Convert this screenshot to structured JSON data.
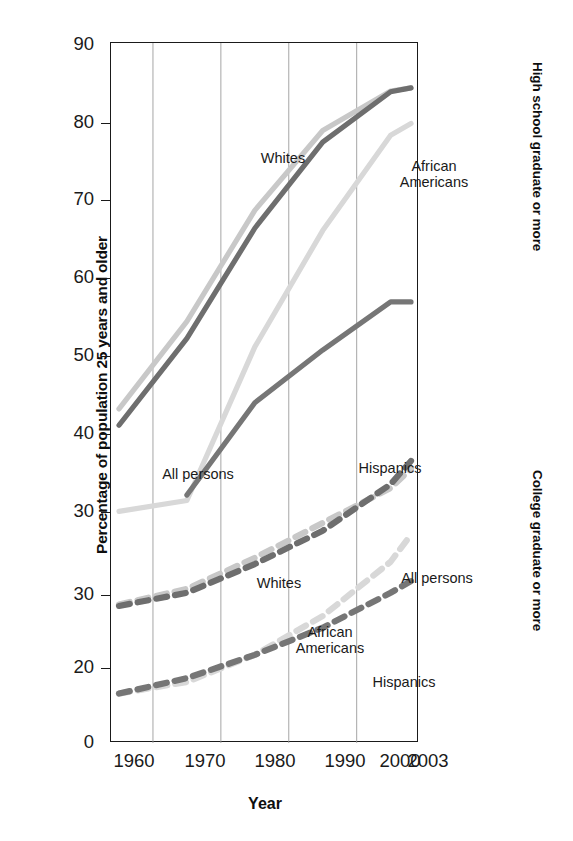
{
  "chart_data": {
    "type": "line",
    "title": "",
    "xlabel": "Year",
    "ylabel": "Percentage of population 25 years and older",
    "xlim": [
      1960,
      2003
    ],
    "ylim": [
      0,
      90
    ],
    "grid": true,
    "legend_position": "inline-annotations",
    "x_tick_labels": [
      "1960",
      "1970",
      "1980",
      "1990",
      "2000",
      "2003"
    ],
    "x_tick_values": [
      1960,
      1970,
      1980,
      1990,
      2000,
      2003
    ],
    "y_tick_labels": [
      "90",
      "80",
      "70",
      "60",
      "50",
      "40",
      "30",
      "30",
      "20",
      "0"
    ],
    "y_tick_values": [
      90,
      80,
      70,
      60,
      50,
      40,
      30,
      20,
      10,
      0
    ],
    "gridline_x_values": [
      1965,
      1975,
      1985,
      1995
    ],
    "sections": {
      "upper": "High school graduate or more",
      "lower": "College graduate or more"
    },
    "series": [
      {
        "name": "Whites",
        "group": "High school graduate or more",
        "style": "solid",
        "color": "#c8c8c8",
        "x": [
          1960,
          1970,
          1980,
          1990,
          2000,
          2003
        ],
        "values": [
          43.2,
          54.5,
          68.8,
          79.1,
          84.2,
          84.6
        ]
      },
      {
        "name": "All persons",
        "group": "High school graduate or more",
        "style": "solid",
        "color": "#6e6e6e",
        "x": [
          1960,
          1970,
          1980,
          1990,
          2000,
          2003
        ],
        "values": [
          41.1,
          52.3,
          66.5,
          77.6,
          84.1,
          84.6
        ]
      },
      {
        "name": "African Americans",
        "group": "High school graduate or more",
        "style": "solid",
        "color": "#d8d8d8",
        "x": [
          1960,
          1970,
          1980,
          1990,
          2000,
          2003
        ],
        "values": [
          30.0,
          31.4,
          51.2,
          66.2,
          78.5,
          80.0
        ]
      },
      {
        "name": "Hispanics",
        "group": "High school graduate or more",
        "style": "solid",
        "color": "#767676",
        "x": [
          1970,
          1980,
          1990,
          2000,
          2003
        ],
        "values": [
          32.1,
          44.0,
          50.8,
          57.0,
          57.0
        ]
      },
      {
        "name": "Whites",
        "group": "College graduate or more",
        "style": "dashed",
        "color": "#c8c8c8",
        "x": [
          1960,
          1970,
          1980,
          1990,
          2000,
          2003
        ],
        "values": [
          18.0,
          20.0,
          24.0,
          28.5,
          33.0,
          35.5
        ]
      },
      {
        "name": "All persons",
        "group": "College graduate or more",
        "style": "dashed",
        "color": "#6e6e6e",
        "x": [
          1960,
          1970,
          1980,
          1990,
          2000,
          2003
        ],
        "values": [
          17.8,
          19.5,
          23.2,
          27.5,
          33.5,
          36.5
        ]
      },
      {
        "name": "African Americans",
        "group": "College graduate or more",
        "style": "dashed",
        "color": "#d8d8d8",
        "x": [
          1960,
          1970,
          1980,
          1990,
          2000,
          2003
        ],
        "values": [
          6.5,
          8.0,
          11.5,
          16.5,
          23.5,
          27.0
        ]
      },
      {
        "name": "Hispanics",
        "group": "College graduate or more",
        "style": "dashed",
        "color": "#767676",
        "x": [
          1960,
          1970,
          1980,
          1990,
          2000,
          2003
        ],
        "values": [
          6.5,
          8.5,
          11.5,
          15.0,
          19.5,
          21.0
        ]
      }
    ],
    "annotations": [
      {
        "id": "whites-hs",
        "text": "Whites",
        "x_px": 283,
        "y_px": 160
      },
      {
        "id": "aa-hs",
        "text": "African\nAmericans",
        "x_px": 434,
        "y_px": 168
      },
      {
        "id": "all-hs",
        "text": "All persons",
        "x_px": 198,
        "y_px": 476
      },
      {
        "id": "hisp-hs",
        "text": "Hispanics",
        "x_px": 390,
        "y_px": 470
      },
      {
        "id": "whites-col",
        "text": "Whites",
        "x_px": 279,
        "y_px": 585
      },
      {
        "id": "aa-col",
        "text": "African\nAmericans",
        "x_px": 330,
        "y_px": 634
      },
      {
        "id": "all-col",
        "text": "All persons",
        "x_px": 437,
        "y_px": 580
      },
      {
        "id": "hisp-col",
        "text": "Hispanics",
        "x_px": 404,
        "y_px": 684
      }
    ]
  },
  "axes": {
    "y_title": "Percentage of population 25 years and older",
    "x_title": "Year"
  },
  "side_labels": {
    "high_school": "High school graduate or more",
    "college": "College graduate or more"
  },
  "colors": {
    "light": "#c8c8c8",
    "lighter": "#d8d8d8",
    "dark": "#6e6e6e",
    "mid": "#767676",
    "axis": "#1a1a1a",
    "grid": "#9b9b9b"
  }
}
